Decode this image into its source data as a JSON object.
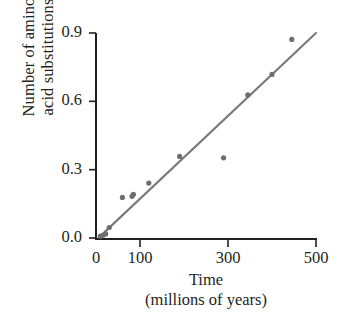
{
  "chart_data": {
    "type": "scatter",
    "title": "",
    "subtitle": "",
    "xlabel": "Time",
    "xlabel_sub": "(millions of years)",
    "ylabel_line1": "Number of amino",
    "ylabel_line2": "acid substitutions",
    "xlim": [
      0,
      500
    ],
    "ylim": [
      0.0,
      0.9
    ],
    "xticks": [
      0,
      100,
      300,
      500
    ],
    "xtick_labels": [
      "0",
      "100",
      "300",
      "500"
    ],
    "yticks": [
      0.0,
      0.3,
      0.6,
      0.9
    ],
    "ytick_labels": [
      "0.0",
      "0.3",
      "0.6",
      "0.9"
    ],
    "grid": false,
    "legend": false,
    "legend_position": "none",
    "point_color": "#6e6e70",
    "line_color": "#79797b",
    "axis_color": "#231f20",
    "text_color": "#231f20",
    "marker_radius": 2.6,
    "trendline": {
      "type": "line",
      "x": [
        8,
        500
      ],
      "y": [
        0.005,
        0.9
      ]
    },
    "points": [
      {
        "x": 10,
        "y": 0.008
      },
      {
        "x": 16,
        "y": 0.012
      },
      {
        "x": 22,
        "y": 0.018
      },
      {
        "x": 30,
        "y": 0.046
      },
      {
        "x": 60,
        "y": 0.178
      },
      {
        "x": 82,
        "y": 0.183
      },
      {
        "x": 85,
        "y": 0.192
      },
      {
        "x": 120,
        "y": 0.241
      },
      {
        "x": 190,
        "y": 0.358
      },
      {
        "x": 290,
        "y": 0.352
      },
      {
        "x": 345,
        "y": 0.628
      },
      {
        "x": 400,
        "y": 0.718
      },
      {
        "x": 445,
        "y": 0.872
      }
    ]
  }
}
